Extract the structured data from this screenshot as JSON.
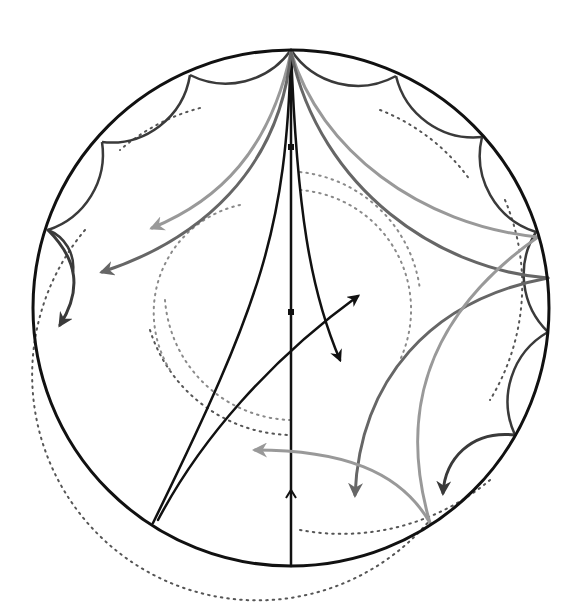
{
  "diagram": {
    "type": "poincare-disk",
    "canvas": {
      "width": 579,
      "height": 608,
      "background": "#ffffff"
    },
    "disk": {
      "cx": 291,
      "cy": 308,
      "r": 258,
      "stroke": "#111111",
      "width": 3
    },
    "colors": {
      "black": "#111111",
      "dark": "#3a3a3a",
      "mid": "#666666",
      "light": "#999999",
      "dotted": "#555555",
      "dotted_light": "#8a8a8a"
    },
    "dotted_circles": [
      {
        "name": "dotted-circle-outer",
        "d": "M 85 230 A 215 215 0 0 0 430 520",
        "color": "dotted"
      },
      {
        "name": "dotted-circle-mid-left",
        "d": "M 150 330 A 150 150 0 0 0 290 435",
        "color": "dotted"
      },
      {
        "name": "dotted-circle-inner-left",
        "d": "M 165 300 A 130 130 0 0 0 290 420",
        "color": "dotted_light"
      },
      {
        "name": "dotted-circle-upper-a",
        "d": "M 200 108 A 200 200 0 0 0 120 150",
        "color": "dotted"
      },
      {
        "name": "dotted-circle-upper-b",
        "d": "M 380 110 A 200 200 0 0 1 470 180",
        "color": "dotted"
      },
      {
        "name": "dotted-circle-right",
        "d": "M 505 200 A 220 220 0 0 1 490 400",
        "color": "dotted"
      },
      {
        "name": "dotted-circle-inner-right",
        "d": "M 300 172 A 135 135 0 0 1 420 290",
        "color": "dotted_light"
      },
      {
        "name": "dotted-circle-inner-right-2",
        "d": "M 300 190 A 120 120 0 0 1 400 360",
        "color": "dotted_light"
      },
      {
        "name": "dotted-circle-lower-right",
        "d": "M 300 530 A 230 230 0 0 0 490 480",
        "color": "dotted"
      },
      {
        "name": "dotted-circle-center-left",
        "d": "M 240 205 A 110 110 0 0 0 170 370",
        "color": "dotted_light"
      }
    ],
    "boundary_arcs": [
      {
        "name": "boundary-arc-1",
        "d": "M 291 50 A 80 80 0 0 1 190 75"
      },
      {
        "name": "boundary-arc-2",
        "d": "M 190 75 A 80 80 0 0 1 102 142"
      },
      {
        "name": "boundary-arc-3",
        "d": "M 102 142 A 80 80 0 0 1 48 230"
      },
      {
        "name": "boundary-arc-4",
        "d": "M 48 230 A 40 40 0 0 1 73 272"
      },
      {
        "name": "boundary-arc-5",
        "d": "M 291 50 A 80 80 0 0 0 396 76"
      },
      {
        "name": "boundary-arc-6",
        "d": "M 396 76 A 80 80 0 0 0 482 137"
      },
      {
        "name": "boundary-arc-7",
        "d": "M 482 137 A 80 80 0 0 0 536 232"
      },
      {
        "name": "boundary-arc-8",
        "d": "M 536 232 A 80 80 0 0 0 548 332"
      },
      {
        "name": "boundary-arc-9",
        "d": "M 548 332 A 80 80 0 0 0 515 435"
      }
    ],
    "geodesics": [
      {
        "name": "geodesic-vertical-diameter",
        "d": "M 291 50 L 291 566",
        "color": "black",
        "width": 2.5
      },
      {
        "name": "geodesic-left-cusp",
        "d": "M 291 50 C 286 230, 262 300, 153 523",
        "color": "black",
        "width": 2.5
      },
      {
        "name": "geodesic-right-cusp",
        "d": "M 291 50 C 297 210, 310 290, 340 360",
        "color": "black",
        "width": 2.5,
        "arrow_end": true
      },
      {
        "name": "geodesic-cross",
        "d": "M 158 520 C 200 440, 270 360, 358 296",
        "color": "black",
        "width": 2.5,
        "arrow_end": true
      },
      {
        "name": "geodesic-upper-left-light",
        "d": "M 291 52 C 270 150, 220 200, 152 228",
        "color": "light",
        "width": 3,
        "arrow_end": true
      },
      {
        "name": "geodesic-upper-left-dark",
        "d": "M 291 52 C 280 170, 200 240, 102 272",
        "color": "mid",
        "width": 3,
        "arrow_end": true
      },
      {
        "name": "geodesic-boundary-left",
        "d": "M 48 230 C 78 260, 82 290, 60 325",
        "color": "dark",
        "width": 3,
        "arrow_end": true
      },
      {
        "name": "geodesic-top-right-light",
        "d": "M 291 52 C 320 150, 420 225, 538 237",
        "color": "light",
        "width": 3
      },
      {
        "name": "geodesic-top-right-dark",
        "d": "M 291 52 C 320 190, 440 270, 548 278",
        "color": "mid",
        "width": 3
      },
      {
        "name": "geodesic-right-to-bottom-dark",
        "d": "M 548 278 C 430 300, 360 380, 355 495",
        "color": "mid",
        "width": 3,
        "arrow_end": true
      },
      {
        "name": "geodesic-right-to-bottom-light",
        "d": "M 538 237 C 420 320, 400 420, 430 523",
        "color": "light",
        "width": 3
      },
      {
        "name": "geodesic-bottom-to-left",
        "d": "M 430 523 C 400 470, 340 450, 255 450",
        "color": "light",
        "width": 3,
        "arrow_end": true
      },
      {
        "name": "geodesic-boundary-right",
        "d": "M 515 435 C 470 430, 445 460, 443 493",
        "color": "dark",
        "width": 3,
        "arrow_end": true
      }
    ],
    "markers": [
      {
        "name": "square-marker-upper",
        "x": 288,
        "y": 144,
        "size": 6
      },
      {
        "name": "square-marker-center",
        "x": 288,
        "y": 309,
        "size": 6
      }
    ],
    "small_arrows": [
      {
        "name": "upward-arrowhead",
        "x": 291,
        "y": 490,
        "direction": "up"
      }
    ]
  }
}
